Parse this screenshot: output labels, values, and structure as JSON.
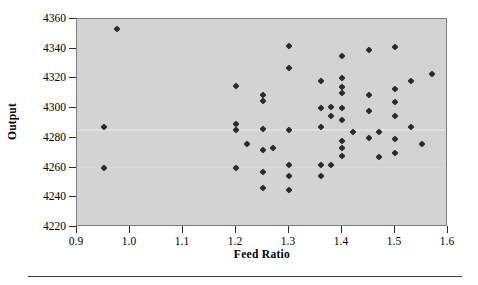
{
  "chart_data": {
    "type": "scatter",
    "title": "",
    "xlabel": "Feed Ratio",
    "ylabel": "Output",
    "xlim": [
      0.9,
      1.6
    ],
    "ylim": [
      4220,
      4360
    ],
    "xticks": [
      "0.9",
      "1.0",
      "1.1",
      "1.2",
      "1.3",
      "1.4",
      "1.5",
      "1.6"
    ],
    "xtick_values": [
      0.9,
      1.0,
      1.1,
      1.2,
      1.3,
      1.4,
      1.5,
      1.6
    ],
    "yticks": [
      "4220",
      "4240",
      "4260",
      "4280",
      "4300",
      "4320",
      "4340",
      "4360"
    ],
    "ytick_values": [
      4220,
      4240,
      4260,
      4280,
      4300,
      4320,
      4340,
      4360
    ],
    "grid": false,
    "legend": null,
    "marker": "diamond",
    "marker_color": "#2b2b2b",
    "plot_background": "#d3d3d3",
    "frame_color": "#7e7e7e",
    "points": [
      [
        0.975,
        4353
      ],
      [
        0.95,
        4287
      ],
      [
        0.95,
        4260
      ],
      [
        1.2,
        4315
      ],
      [
        1.2,
        4289
      ],
      [
        1.2,
        4285
      ],
      [
        1.2,
        4260
      ],
      [
        1.22,
        4276
      ],
      [
        1.25,
        4309
      ],
      [
        1.25,
        4305
      ],
      [
        1.25,
        4286
      ],
      [
        1.25,
        4272
      ],
      [
        1.25,
        4257
      ],
      [
        1.25,
        4246
      ],
      [
        1.27,
        4273
      ],
      [
        1.3,
        4342
      ],
      [
        1.3,
        4327
      ],
      [
        1.3,
        4285
      ],
      [
        1.3,
        4262
      ],
      [
        1.3,
        4254
      ],
      [
        1.3,
        4245
      ],
      [
        1.36,
        4318
      ],
      [
        1.36,
        4300
      ],
      [
        1.36,
        4287
      ],
      [
        1.36,
        4262
      ],
      [
        1.36,
        4254
      ],
      [
        1.38,
        4301
      ],
      [
        1.38,
        4295
      ],
      [
        1.38,
        4262
      ],
      [
        1.4,
        4335
      ],
      [
        1.4,
        4320
      ],
      [
        1.4,
        4314
      ],
      [
        1.4,
        4310
      ],
      [
        1.4,
        4300
      ],
      [
        1.4,
        4292
      ],
      [
        1.4,
        4278
      ],
      [
        1.4,
        4273
      ],
      [
        1.4,
        4268
      ],
      [
        1.42,
        4284
      ],
      [
        1.45,
        4339
      ],
      [
        1.45,
        4309
      ],
      [
        1.45,
        4298
      ],
      [
        1.45,
        4280
      ],
      [
        1.47,
        4284
      ],
      [
        1.47,
        4267
      ],
      [
        1.5,
        4341
      ],
      [
        1.5,
        4313
      ],
      [
        1.5,
        4304
      ],
      [
        1.5,
        4295
      ],
      [
        1.5,
        4279
      ],
      [
        1.5,
        4270
      ],
      [
        1.53,
        4318
      ],
      [
        1.53,
        4287
      ],
      [
        1.55,
        4276
      ],
      [
        1.57,
        4323
      ]
    ]
  }
}
